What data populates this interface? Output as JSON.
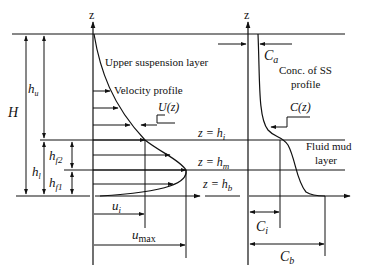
{
  "diagram": {
    "axis_label_left": "z",
    "axis_label_right": "z",
    "labels": {
      "upper_layer": "Upper suspension layer",
      "velocity_profile": "Velocity profile",
      "u_of_z": "U(z)",
      "conc_title_line1": "Conc. of SS",
      "conc_title_line2": "profile",
      "c_of_z": "C(z)",
      "fluid_mud_line1": "Fluid mud",
      "fluid_mud_line2": "layer",
      "z_hi": "z = h",
      "z_hi_sub": "i",
      "z_hm": "z = h",
      "z_hm_sub": "m",
      "z_hb": "z = h",
      "z_hb_sub": "b"
    },
    "dimensions": {
      "H": "H",
      "hu": "h",
      "hu_sub": "u",
      "hl": "h",
      "hl_sub": "l",
      "hf2": "h",
      "hf2_sub": "f2",
      "hf1": "h",
      "hf1_sub": "f1",
      "ui": "u",
      "ui_sub": "i",
      "umax": "u",
      "umax_sub": "max",
      "Ca": "C",
      "Ca_sub": "a",
      "Ci": "C",
      "Ci_sub": "i",
      "Cb": "C",
      "Cb_sub": "b"
    }
  }
}
